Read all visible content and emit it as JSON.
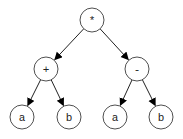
{
  "diagram": {
    "type": "expression-tree",
    "nodes": [
      {
        "id": "root",
        "label": "*",
        "x": 92,
        "y": 20
      },
      {
        "id": "plus",
        "label": "+",
        "x": 46,
        "y": 69
      },
      {
        "id": "minus",
        "label": "-",
        "x": 137,
        "y": 69
      },
      {
        "id": "a1",
        "label": "a",
        "x": 22,
        "y": 117
      },
      {
        "id": "b1",
        "label": "b",
        "x": 69,
        "y": 117
      },
      {
        "id": "a2",
        "label": "a",
        "x": 115,
        "y": 117
      },
      {
        "id": "b2",
        "label": "b",
        "x": 161,
        "y": 117
      }
    ],
    "edges": [
      {
        "from": "root",
        "to": "plus"
      },
      {
        "from": "root",
        "to": "minus"
      },
      {
        "from": "plus",
        "to": "a1"
      },
      {
        "from": "plus",
        "to": "b1"
      },
      {
        "from": "minus",
        "to": "a2"
      },
      {
        "from": "minus",
        "to": "b2"
      }
    ],
    "colors": {
      "stroke": "#222222",
      "fill": "#ffffff",
      "arrow": "#000000"
    }
  }
}
